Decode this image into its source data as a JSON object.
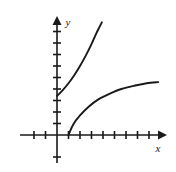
{
  "figure": {
    "title": "",
    "background_color": "#ffffff",
    "ink_color": "#1a1a1a",
    "width": 176,
    "height": 172
  },
  "axes": {
    "x_label": "x",
    "y_label": "y",
    "origin_px": {
      "x": 57,
      "y": 135
    },
    "unit_px": 11.5,
    "x_axis": {
      "start_px": {
        "x": 20,
        "y": 135
      },
      "end_px": {
        "x": 165,
        "y": 135
      },
      "arrow": "right",
      "tick_values": [
        -2,
        -1,
        1,
        2,
        3,
        4,
        5,
        6,
        7,
        8
      ],
      "tick_half_length_px": 4
    },
    "y_axis": {
      "start_px": {
        "x": 57,
        "y": 163
      },
      "end_px": {
        "x": 57,
        "y": 18
      },
      "arrow": "up",
      "tick_values": [
        -2,
        1,
        2,
        3,
        4,
        5,
        6,
        7,
        8,
        9
      ],
      "tick_half_length_px": 4
    }
  },
  "chart_data": {
    "type": "line",
    "title": "",
    "xlabel": "x",
    "ylabel": "y",
    "grid": false,
    "legend": "none",
    "xlim": [
      -3.2,
      9.4
    ],
    "ylim": [
      -2.6,
      10.2
    ],
    "series": [
      {
        "name": "upper-curve",
        "description": "increasing concave-up curve from the y-axis rising steeply to the upper right",
        "start_point": {
          "x": 0,
          "y": 3.4
        },
        "end_point": {
          "x": 3.9,
          "y": 9.8
        },
        "points": [
          {
            "x": 0.0,
            "y": 3.4
          },
          {
            "x": 0.5,
            "y": 3.9
          },
          {
            "x": 1.0,
            "y": 4.5
          },
          {
            "x": 1.5,
            "y": 5.2
          },
          {
            "x": 2.0,
            "y": 6.0
          },
          {
            "x": 2.5,
            "y": 6.9
          },
          {
            "x": 3.0,
            "y": 7.9
          },
          {
            "x": 3.4,
            "y": 8.8
          },
          {
            "x": 3.7,
            "y": 9.4
          },
          {
            "x": 3.9,
            "y": 9.8
          }
        ]
      },
      {
        "name": "lower-curve",
        "description": "increasing concave-down curve beginning on the x-axis at x = 1 and flattening toward the right",
        "start_point": {
          "x": 1.0,
          "y": 0.0
        },
        "end_point": {
          "x": 8.8,
          "y": 4.6
        },
        "points": [
          {
            "x": 1.0,
            "y": 0.0
          },
          {
            "x": 1.4,
            "y": 0.9
          },
          {
            "x": 2.0,
            "y": 1.7
          },
          {
            "x": 2.8,
            "y": 2.5
          },
          {
            "x": 3.6,
            "y": 3.1
          },
          {
            "x": 4.6,
            "y": 3.6
          },
          {
            "x": 5.6,
            "y": 4.0
          },
          {
            "x": 6.8,
            "y": 4.3
          },
          {
            "x": 7.8,
            "y": 4.5
          },
          {
            "x": 8.8,
            "y": 4.6
          }
        ]
      }
    ]
  }
}
